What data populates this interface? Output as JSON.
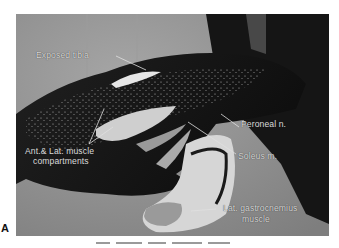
{
  "figure": {
    "panel_letter": "A",
    "photo_description": "Intraoperative black-and-white photograph of an exposed lower leg showing muscle compartments",
    "labels": {
      "exposed_tibia": "Exposed tibia",
      "ant_lat_line1": "Ant.& Lat. muscle",
      "ant_lat_line2": "compartments",
      "peroneal": "Peroneal n.",
      "soleus": "Soleus m.",
      "lat_gastroc_line1": "Lat. gastrocnemius",
      "lat_gastroc_line2": "muscle"
    },
    "colors": {
      "label_text": "#d8d8d8",
      "background": "#8e8e8e",
      "tissue_dark": "#1a1a1a",
      "highlight": "#e6e6e6"
    }
  }
}
